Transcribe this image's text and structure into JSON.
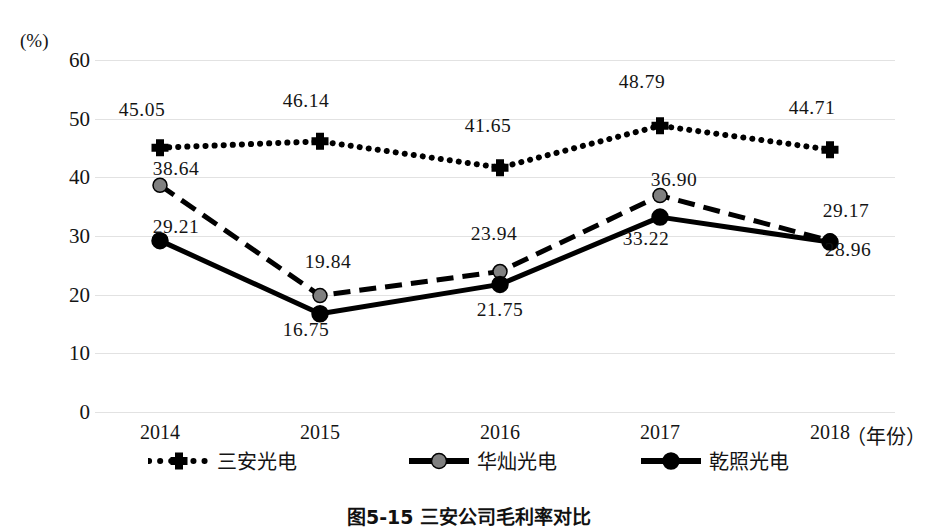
{
  "chart_data": {
    "type": "line",
    "title": "图5-15 三安公司毛利率对比",
    "xlabel": "（年份）",
    "ylabel": "(%)",
    "ylim": [
      0,
      60
    ],
    "yticks": [
      0,
      10,
      20,
      30,
      40,
      50,
      60
    ],
    "grid": true,
    "legend_position": "bottom",
    "categories": [
      "2014",
      "2015",
      "2016",
      "2017",
      "2018"
    ],
    "series": [
      {
        "name": "三安光电",
        "style": "dotted",
        "marker": "cross",
        "color": "#000000",
        "values": [
          45.05,
          46.14,
          41.65,
          48.79,
          44.71
        ],
        "labels": [
          "45.05",
          "46.14",
          "41.65",
          "48.79",
          "44.71"
        ]
      },
      {
        "name": "华灿光电",
        "style": "dashed",
        "marker": "circle-gray",
        "color": "#000000",
        "marker_color": "#808080",
        "values": [
          38.64,
          19.84,
          23.94,
          36.9,
          29.17
        ],
        "labels": [
          "38.64",
          "19.84",
          "23.94",
          "36.90",
          "29.17"
        ]
      },
      {
        "name": "乾照光电",
        "style": "solid",
        "marker": "circle-black",
        "color": "#000000",
        "marker_color": "#000000",
        "values": [
          29.21,
          16.75,
          21.75,
          33.22,
          28.96
        ],
        "labels": [
          "29.21",
          "16.75",
          "21.75",
          "33.22",
          "28.96"
        ]
      }
    ]
  },
  "axis": {
    "unit_label": "(%)",
    "y_ticks": [
      "60",
      "50",
      "40",
      "30",
      "20",
      "10",
      "0"
    ],
    "x_ticks": [
      "2014",
      "2015",
      "2016",
      "2017",
      "2018",
      "（年份）"
    ]
  },
  "legend": {
    "items": [
      {
        "label": "三安光电"
      },
      {
        "label": "华灿光电"
      },
      {
        "label": "乾照光电"
      }
    ]
  },
  "caption": {
    "text": "图5-15 三安公司毛利率对比"
  }
}
